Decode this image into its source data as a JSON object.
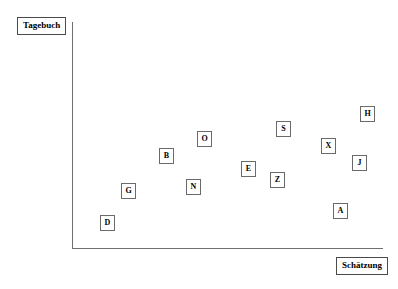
{
  "chart_data": {
    "type": "scatter",
    "title": "",
    "xlabel": "Schätzung",
    "ylabel": "Tagebuch",
    "grid": false,
    "legend": "none",
    "axes": {
      "x_ticks": [],
      "y_ticks": [],
      "xlim": [
        0,
        100
      ],
      "ylim": [
        0,
        100
      ]
    },
    "points": [
      {
        "label": "D",
        "x": 11,
        "y": 11.5
      },
      {
        "label": "G",
        "x": 18.5,
        "y": 27.5
      },
      {
        "label": "B",
        "x": 30,
        "y": 43.5
      },
      {
        "label": "N",
        "x": 40,
        "y": 27.5
      },
      {
        "label": "O",
        "x": 45,
        "y": 52.5
      },
      {
        "label": "E",
        "x": 57,
        "y": 36.5
      },
      {
        "label": "Z",
        "x": 66,
        "y": 31.5
      },
      {
        "label": "S",
        "x": 68,
        "y": 55.5
      },
      {
        "label": "A",
        "x": 87,
        "y": 17.5
      },
      {
        "label": "X",
        "x": 83,
        "y": 47
      },
      {
        "label": "J",
        "x": 93,
        "y": 40.5
      },
      {
        "label": "H",
        "x": 97,
        "y": 60.5
      }
    ]
  },
  "axis_titles": {
    "y": "Tagebuch",
    "x": "Schätzung"
  },
  "markers": [
    {
      "name": "data-point-h",
      "label": "H",
      "left": 360,
      "top": 106
    },
    {
      "name": "data-point-s",
      "label": "S",
      "left": 276,
      "top": 121
    },
    {
      "name": "data-point-o",
      "label": "O",
      "left": 197,
      "top": 131
    },
    {
      "name": "data-point-x",
      "label": "X",
      "left": 321,
      "top": 138
    },
    {
      "name": "data-point-b",
      "label": "B",
      "left": 159,
      "top": 148
    },
    {
      "name": "data-point-j",
      "label": "J",
      "left": 352,
      "top": 155
    },
    {
      "name": "data-point-e",
      "label": "E",
      "left": 241,
      "top": 161
    },
    {
      "name": "data-point-z",
      "label": "Z",
      "left": 270,
      "top": 172
    },
    {
      "name": "data-point-g",
      "label": "G",
      "left": 121,
      "top": 183
    },
    {
      "name": "data-point-n",
      "label": "N",
      "left": 186,
      "top": 179
    },
    {
      "name": "data-point-a",
      "label": "A",
      "left": 333,
      "top": 203
    },
    {
      "name": "data-point-d",
      "label": "D",
      "left": 100,
      "top": 215
    }
  ]
}
